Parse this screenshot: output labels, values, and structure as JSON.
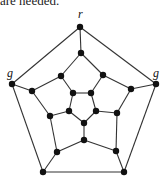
{
  "caption_fragment": "are needed.",
  "diagram": {
    "type": "graph",
    "name": "dodecahedron graph",
    "labels": [
      {
        "text": "r",
        "x": 78,
        "y": 18
      },
      {
        "text": "g",
        "x": 7,
        "y": 77
      },
      {
        "text": "g",
        "x": 153,
        "y": 77
      }
    ],
    "nodes": [
      {
        "id": 1,
        "x": 80,
        "y": 27
      },
      {
        "id": 2,
        "x": 156,
        "y": 84
      },
      {
        "id": 3,
        "x": 124,
        "y": 172
      },
      {
        "id": 4,
        "x": 43,
        "y": 172
      },
      {
        "id": 5,
        "x": 12,
        "y": 84
      },
      {
        "id": 6,
        "x": 81,
        "y": 53
      },
      {
        "id": 7,
        "x": 103,
        "y": 75
      },
      {
        "id": 8,
        "x": 131,
        "y": 89
      },
      {
        "id": 9,
        "x": 117,
        "y": 113
      },
      {
        "id": 10,
        "x": 116,
        "y": 151
      },
      {
        "id": 11,
        "x": 84,
        "y": 140
      },
      {
        "id": 12,
        "x": 57,
        "y": 152
      },
      {
        "id": 13,
        "x": 50,
        "y": 116
      },
      {
        "id": 14,
        "x": 32,
        "y": 91
      },
      {
        "id": 15,
        "x": 61,
        "y": 76
      },
      {
        "id": 16,
        "x": 73,
        "y": 93
      },
      {
        "id": 17,
        "x": 91,
        "y": 93
      },
      {
        "id": 18,
        "x": 96,
        "y": 111
      },
      {
        "id": 19,
        "x": 84,
        "y": 123
      },
      {
        "id": 20,
        "x": 69,
        "y": 111
      }
    ],
    "edges": [
      [
        1,
        2
      ],
      [
        2,
        3
      ],
      [
        3,
        4
      ],
      [
        4,
        5
      ],
      [
        5,
        1
      ],
      [
        1,
        6
      ],
      [
        2,
        8
      ],
      [
        3,
        10
      ],
      [
        4,
        12
      ],
      [
        5,
        14
      ],
      [
        6,
        7
      ],
      [
        7,
        8
      ],
      [
        8,
        9
      ],
      [
        9,
        10
      ],
      [
        10,
        11
      ],
      [
        11,
        12
      ],
      [
        12,
        13
      ],
      [
        13,
        14
      ],
      [
        14,
        15
      ],
      [
        15,
        6
      ],
      [
        7,
        17
      ],
      [
        9,
        18
      ],
      [
        11,
        19
      ],
      [
        13,
        20
      ],
      [
        15,
        16
      ],
      [
        16,
        17
      ],
      [
        17,
        18
      ],
      [
        18,
        19
      ],
      [
        19,
        20
      ],
      [
        20,
        16
      ]
    ]
  }
}
